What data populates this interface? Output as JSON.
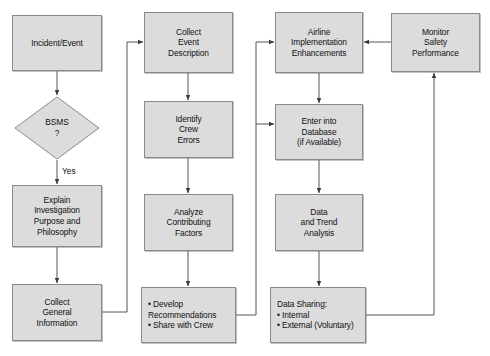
{
  "diagram": {
    "canvas": {
      "width": 490,
      "height": 356
    },
    "style": {
      "node_fill": "#dcdcdc",
      "node_border": "#8a8a8a",
      "edge_color": "#555555",
      "text_color": "#111111",
      "background": "#ffffff"
    },
    "nodes": [
      {
        "id": "incident",
        "shape": "rect",
        "label": "Incident/Event",
        "x": 12,
        "y": 15,
        "w": 90,
        "h": 56
      },
      {
        "id": "bsms",
        "shape": "diamond",
        "label": "BSMS\n?",
        "x": 14,
        "y": 96,
        "w": 86,
        "h": 64
      },
      {
        "id": "explain",
        "shape": "rect",
        "label": "Explain\nInvestigation\nPurpose and\nPhilosophy",
        "x": 12,
        "y": 185,
        "w": 90,
        "h": 62
      },
      {
        "id": "collect-general",
        "shape": "rect",
        "label": "Collect\nGeneral\nInformation",
        "x": 12,
        "y": 284,
        "w": 90,
        "h": 57
      },
      {
        "id": "collect-event",
        "shape": "rect",
        "label": "Collect\nEvent\nDescription",
        "x": 144,
        "y": 12,
        "w": 89,
        "h": 61
      },
      {
        "id": "identify-crew",
        "shape": "rect",
        "label": "Identify\nCrew\nErrors",
        "x": 144,
        "y": 101,
        "w": 89,
        "h": 57
      },
      {
        "id": "analyze",
        "shape": "rect",
        "label": "Analyze\nContributing\nFactors",
        "x": 144,
        "y": 194,
        "w": 89,
        "h": 57
      },
      {
        "id": "develop",
        "shape": "rect",
        "label": "• Develop\n   Recommendations\n• Share with Crew",
        "x": 141,
        "y": 287,
        "w": 95,
        "h": 56,
        "bulleted": true
      },
      {
        "id": "airline",
        "shape": "rect",
        "label": "Airline\nImplementation\nEnhancements",
        "x": 275,
        "y": 12,
        "w": 88,
        "h": 61
      },
      {
        "id": "database",
        "shape": "rect",
        "label": "Enter into\nDatabase\n(if Available)",
        "x": 275,
        "y": 104,
        "w": 88,
        "h": 56
      },
      {
        "id": "trend",
        "shape": "rect",
        "label": "Data\nand Trend\nAnalysis",
        "x": 275,
        "y": 194,
        "w": 88,
        "h": 57
      },
      {
        "id": "sharing",
        "shape": "rect",
        "label": "Data Sharing:\n• Internal\n• External (Voluntary)",
        "x": 270,
        "y": 287,
        "w": 96,
        "h": 56,
        "bulleted": true
      },
      {
        "id": "monitor",
        "shape": "rect",
        "label": "Monitor\nSafety\nPerformance",
        "x": 391,
        "y": 13,
        "w": 89,
        "h": 59
      }
    ],
    "edge_labels": [
      {
        "id": "yes-label",
        "text": "Yes",
        "x": 62,
        "y": 166
      }
    ]
  }
}
